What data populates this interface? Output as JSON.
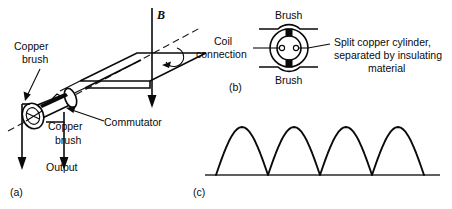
{
  "figure": {
    "caption_parts": {
      "a": "(a)",
      "b": "(b)",
      "c": "(c)"
    },
    "labels": {
      "copper_brush_top_line1": "Copper",
      "copper_brush_top_line2": "brush",
      "copper_brush_bottom_line1": "Copper",
      "copper_brush_bottom_line2": "brush",
      "commutator": "Commutator",
      "output": "Output",
      "field_symbol": "B",
      "coil_connection_line1": "Coil",
      "coil_connection_line2": "connection",
      "brush_upper": "Brush",
      "brush_lower": "Brush",
      "split_cylinder_line1": "Split copper cylinder,",
      "split_cylinder_line2": "separated by insulating",
      "split_cylinder_line3": "material"
    },
    "colors": {
      "ink": "#0a0a0a",
      "background": "#ffffff",
      "baseline": "#2a2a2a"
    }
  },
  "chart_data": {
    "type": "line",
    "title": "",
    "subtitle": "",
    "xlabel": "",
    "ylabel": "",
    "grid": false,
    "legend_position": "none",
    "xlim": [
      0,
      4
    ],
    "ylim": [
      0,
      1
    ],
    "x": [
      0.0,
      0.05,
      0.1,
      0.15,
      0.2,
      0.25,
      0.3,
      0.35,
      0.4,
      0.45,
      0.5,
      0.55,
      0.6,
      0.65,
      0.7,
      0.75,
      0.8,
      0.85,
      0.9,
      0.95,
      1.0
    ],
    "series": [
      {
        "name": "Output voltage",
        "hump_count": 4,
        "values": [
          0.0,
          0.156,
          0.309,
          0.454,
          0.588,
          0.707,
          0.809,
          0.891,
          0.951,
          0.988,
          1.0,
          0.988,
          0.951,
          0.891,
          0.809,
          0.707,
          0.588,
          0.454,
          0.309,
          0.156,
          0.0
        ]
      }
    ],
    "tick_labels": {
      "x": [],
      "y": []
    }
  }
}
